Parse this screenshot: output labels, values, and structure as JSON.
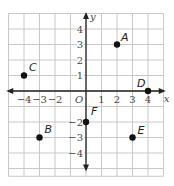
{
  "chart_data": {
    "type": "scatter",
    "title": "",
    "xlabel": "x",
    "ylabel": "y",
    "origin_label": "O",
    "xlim": [
      -5,
      5
    ],
    "ylim": [
      -5.5,
      5
    ],
    "grid": true,
    "x_ticks": [
      -4,
      -3,
      -2,
      1,
      2,
      3,
      4
    ],
    "x_tick_labels": [
      "−4",
      "−3",
      "−2",
      "1",
      "2",
      "3",
      "4"
    ],
    "y_ticks": [
      4,
      3,
      2,
      1,
      -2,
      -3,
      -4
    ],
    "y_tick_labels": [
      "4",
      "3",
      "2",
      "1",
      "−2",
      "−3",
      "−4"
    ],
    "points": [
      {
        "label": "A",
        "x": 2,
        "y": 3
      },
      {
        "label": "B",
        "x": -3,
        "y": -3
      },
      {
        "label": "C",
        "x": -4,
        "y": 1
      },
      {
        "label": "D",
        "x": 4,
        "y": 0
      },
      {
        "label": "E",
        "x": 3,
        "y": -3
      },
      {
        "label": "F",
        "x": 0,
        "y": -2
      }
    ]
  },
  "colors": {
    "grid": "#c8c8c8",
    "axis": "#222222",
    "point": "#111111"
  }
}
